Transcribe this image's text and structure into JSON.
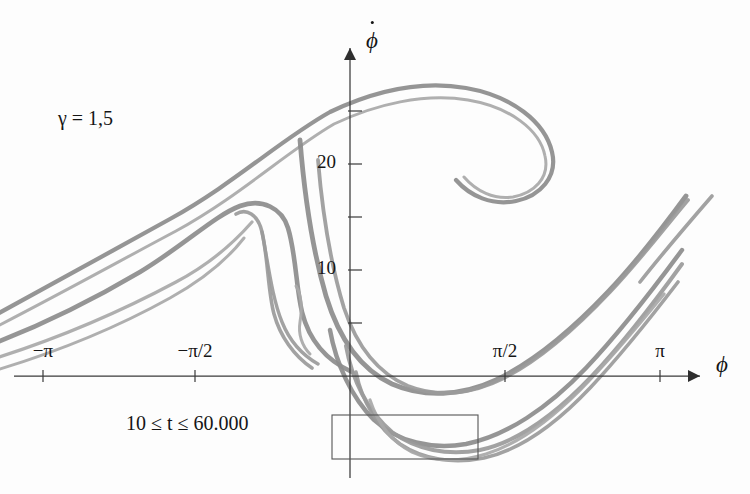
{
  "figure": {
    "gamma_label": "γ = 1,5",
    "time_range_label": "10 ≤ t ≤ 60.000",
    "x_axis_label": "ϕ",
    "y_axis_label": "ϕ",
    "y_axis_has_dot": true,
    "stroke_color": "#9a9a9a",
    "axis_color": "#3a3a3a",
    "background_color": "#fdfdfd"
  },
  "axes": {
    "x_ticks": [
      {
        "label": "−π",
        "value": -3.14159,
        "px": 43
      },
      {
        "label": "−π/2",
        "value": -1.5708,
        "px": 195
      },
      {
        "label": "",
        "value": 0,
        "px": 350
      },
      {
        "label": "π/2",
        "value": 1.5708,
        "px": 505
      },
      {
        "label": "π",
        "value": 3.14159,
        "px": 660
      }
    ],
    "y_ticks": [
      {
        "label": "",
        "value": 5,
        "px": 323
      },
      {
        "label": "10",
        "value": 10,
        "px": 270
      },
      {
        "label": "",
        "value": 15,
        "px": 217
      },
      {
        "label": "20",
        "value": 20,
        "px": 164
      },
      {
        "label": "",
        "value": 25,
        "px": 111
      }
    ],
    "origin_px": {
      "x": 350,
      "y": 376
    },
    "x_range": [
      -3.6,
      3.45
    ],
    "y_range": [
      -3.5,
      29.5
    ]
  },
  "zoom_box": {
    "name": "inset-selection-rectangle",
    "x": 332,
    "y": 415,
    "width": 146,
    "height": 44
  },
  "chart_data": {
    "type": "line",
    "xlabel": "ϕ",
    "ylabel": "ϕ̇",
    "xlim": [
      -3.6,
      3.45
    ],
    "ylim": [
      -3.5,
      29.5
    ],
    "grid": false,
    "legend": false,
    "annotations": [
      {
        "text": "γ = 1,5",
        "x_px": 58,
        "y_px": 107
      },
      {
        "text": "10 ≤ t ≤ 60.000",
        "x_px": 126,
        "y_px": 412
      }
    ],
    "series": [
      {
        "name": "outer-upper-branch",
        "stroke_width": 4.2,
        "points_px": "M -10,318 C 60,280 110,252 170,219 C 235,183 280,140 330,112 C 372,92 420,80 466,88 C 512,96 545,122 552,152 C 558,177 540,196 516,201 C 492,206 470,196 456,180"
      },
      {
        "name": "outer-upper-branch-companion",
        "stroke_width": 3.0,
        "points_px": "M -10,330 C 62,293 114,264 176,231 C 240,196 286,152 334,124 C 376,104 424,93 468,100 C 510,107 540,130 545,156 C 550,178 534,193 513,197 C 494,200 476,191 464,177"
      },
      {
        "name": "second-fold-outer",
        "stroke_width": 4.6,
        "points_px": "M -10,345 C 50,322 96,298 140,272 C 186,244 214,216 240,206 C 262,198 282,208 288,228 C 296,254 296,288 302,312 C 310,344 330,362 352,372"
      },
      {
        "name": "second-fold-inner-loop",
        "stroke_width": 3.6,
        "points_px": "M 236,214 C 246,208 258,214 262,232 C 268,258 268,292 274,314 C 280,336 294,356 312,368"
      },
      {
        "name": "inner-hairpin-outer",
        "stroke_width": 3.4,
        "points_px": "M 262,232 C 268,262 272,298 282,322 C 290,342 304,356 318,364"
      },
      {
        "name": "inner-hairpin-tip",
        "stroke_width": 3.0,
        "points_px": "M 296,286 C 302,296 302,310 300,322 C 298,334 302,346 310,354"
      },
      {
        "name": "left-strand-a",
        "stroke_width": 3.2,
        "points_px": "M -10,360 C 60,338 120,312 176,282 C 214,262 238,238 252,222"
      },
      {
        "name": "left-strand-b",
        "stroke_width": 3.0,
        "points_px": "M -10,372 C 58,352 116,328 170,298 C 206,278 230,256 244,238"
      },
      {
        "name": "descending-main",
        "stroke_width": 4.8,
        "points_px": "M 300,140 C 304,190 312,248 326,296 C 340,342 362,370 392,384 C 424,398 462,396 496,380 C 534,362 572,330 608,292 C 640,258 664,226 686,196"
      },
      {
        "name": "descending-companion",
        "stroke_width": 3.8,
        "points_px": "M 318,160 C 322,208 330,262 344,308 C 358,350 380,374 408,386 C 438,398 472,394 504,378 C 540,360 576,328 610,292 C 642,258 666,226 688,200"
      },
      {
        "name": "lower-basin-outer",
        "stroke_width": 4.4,
        "points_px": "M 330,330 C 336,364 352,398 374,420 C 398,442 432,450 466,444 C 506,436 548,408 586,368 C 622,330 654,288 682,250"
      },
      {
        "name": "lower-basin-inner",
        "stroke_width": 4.0,
        "points_px": "M 346,346 C 352,380 368,412 392,432 C 416,450 448,456 480,450 C 518,442 556,414 592,376 C 626,340 656,300 682,264"
      },
      {
        "name": "lower-basin-deepest",
        "stroke_width": 3.6,
        "points_px": "M 356,372 C 362,402 378,428 400,444 C 424,460 454,464 484,458 C 520,450 556,424 590,388 C 622,354 652,316 678,282"
      },
      {
        "name": "lower-basin-tail",
        "stroke_width": 3.2,
        "points_px": "M 370,400 C 378,424 392,442 412,452 C 434,462 460,462 486,454 C 518,444 550,420 580,390 C 610,360 638,326 664,294"
      },
      {
        "name": "right-exit-upper",
        "stroke_width": 3.6,
        "points_px": "M 640,282 C 662,254 686,226 712,196"
      }
    ]
  }
}
